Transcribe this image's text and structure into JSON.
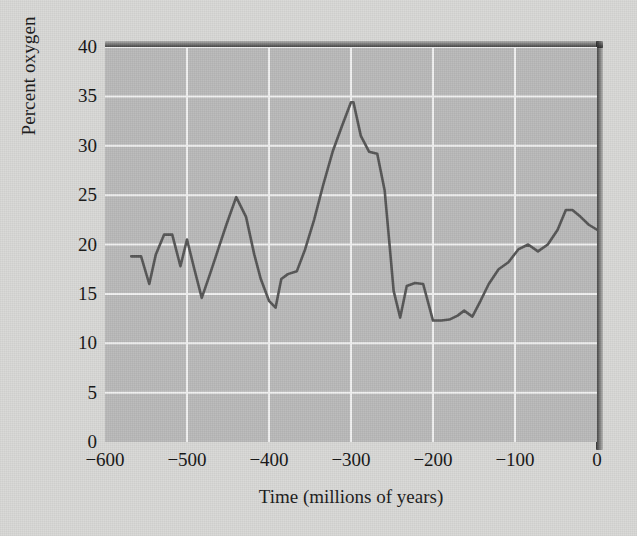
{
  "chart_data": {
    "type": "line",
    "title": "",
    "xlabel": "Time (millions of years)",
    "ylabel": "Percent oxygen",
    "xlim": [
      -600,
      0
    ],
    "ylim": [
      0,
      40
    ],
    "xticks": [
      -600,
      -500,
      -400,
      -300,
      -200,
      -100,
      0
    ],
    "xtick_labels": [
      "−600",
      "−500",
      "−400",
      "−300",
      "−200",
      "−100",
      "0"
    ],
    "yticks": [
      0,
      5,
      10,
      15,
      20,
      25,
      30,
      35,
      40
    ],
    "ytick_labels": [
      "0",
      "5",
      "10",
      "15",
      "20",
      "25",
      "30",
      "35",
      "40"
    ],
    "grid": true,
    "grid_color": "#f2f2f2",
    "plot_bg_color": "#b9b9b9",
    "figure_bg_color": "#d8d8d6",
    "line_color": "#555555",
    "line_width": 2.6,
    "legend": null,
    "series": [
      {
        "name": "Percent oxygen",
        "x": [
          -568,
          -556,
          -546,
          -538,
          -528,
          -518,
          -508,
          -500,
          -491,
          -482,
          -472,
          -462,
          -452,
          -440,
          -428,
          -418,
          -410,
          -400,
          -392,
          -385,
          -377,
          -366,
          -356,
          -345,
          -334,
          -322,
          -311,
          -300,
          -297,
          -288,
          -278,
          -268,
          -259,
          -253,
          -248,
          -240,
          -232,
          -222,
          -212,
          -200,
          -190,
          -180,
          -170,
          -162,
          -152,
          -142,
          -132,
          -120,
          -108,
          -96,
          -84,
          -72,
          -60,
          -48,
          -38,
          -30,
          -20,
          -10,
          0
        ],
        "y": [
          18.8,
          18.8,
          16.0,
          19.0,
          21.0,
          21.0,
          17.8,
          20.5,
          17.5,
          14.6,
          17.0,
          19.5,
          22.0,
          24.8,
          22.8,
          19.0,
          16.5,
          14.3,
          13.6,
          16.5,
          17.0,
          17.3,
          19.5,
          22.5,
          26.0,
          29.5,
          32.0,
          34.4,
          34.4,
          31.0,
          29.4,
          29.2,
          25.5,
          20.0,
          15.3,
          12.6,
          15.8,
          16.1,
          16.0,
          12.3,
          12.3,
          12.4,
          12.8,
          13.3,
          12.7,
          14.3,
          16.0,
          17.5,
          18.2,
          19.5,
          20.0,
          19.3,
          20.0,
          21.5,
          23.5,
          23.5,
          22.8,
          22.0,
          21.5
        ]
      }
    ]
  }
}
